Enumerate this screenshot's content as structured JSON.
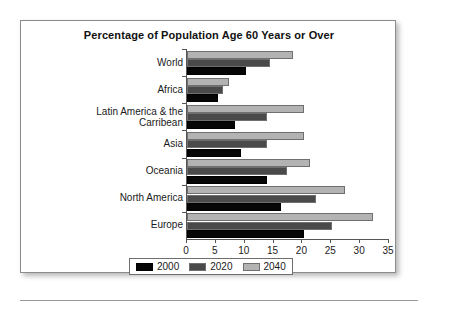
{
  "figure": {
    "title": "Percentage of Population Age 60 Years or Over"
  },
  "legend": {
    "items": [
      {
        "label": "2000",
        "color": "#060606"
      },
      {
        "label": "2020",
        "color": "#4a4a4a"
      },
      {
        "label": "2040",
        "color": "#b3b3b3"
      }
    ]
  },
  "axis": {
    "x_ticks": [
      "0",
      "5",
      "10",
      "15",
      "20",
      "25",
      "30",
      "35"
    ]
  },
  "categories": [
    {
      "line1": "World",
      "line2": ""
    },
    {
      "line1": "Africa",
      "line2": ""
    },
    {
      "line1": "Latin America & the",
      "line2": "Carribean"
    },
    {
      "line1": "Asia",
      "line2": ""
    },
    {
      "line1": "Oceania",
      "line2": ""
    },
    {
      "line1": "North America",
      "line2": ""
    },
    {
      "line1": "Europe",
      "line2": ""
    }
  ],
  "chart_data": {
    "type": "bar",
    "orientation": "horizontal",
    "title": "Percentage of Population Age 60 Years or Over",
    "xlabel": "",
    "ylabel": "",
    "xlim": [
      0,
      35
    ],
    "xticks": [
      0,
      5,
      10,
      15,
      20,
      25,
      30,
      35
    ],
    "grid": false,
    "legend_position": "bottom",
    "categories": [
      "World",
      "Africa",
      "Latin America & the Carribean",
      "Asia",
      "Oceania",
      "North America",
      "Europe"
    ],
    "series": [
      {
        "name": "2000",
        "color": "#060606",
        "values": [
          10.3,
          5.3,
          8.3,
          9.3,
          13.8,
          16.3,
          20.2
        ]
      },
      {
        "name": "2020",
        "color": "#4a4a4a",
        "values": [
          14.3,
          6.3,
          13.8,
          13.8,
          17.3,
          22.3,
          25.2
        ]
      },
      {
        "name": "2040",
        "color": "#b3b3b3",
        "values": [
          18.3,
          7.3,
          20.3,
          20.3,
          21.3,
          27.3,
          32.2
        ]
      }
    ]
  }
}
